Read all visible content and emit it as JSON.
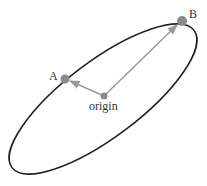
{
  "diagram": {
    "ellipse": {
      "cx": 103,
      "cy": 99,
      "rx": 114,
      "ry": 38,
      "rotation": -37,
      "stroke": "#222222"
    },
    "points": {
      "origin": {
        "label": "origin",
        "x": 104,
        "y": 96
      },
      "A": {
        "label": "A",
        "x": 65,
        "y": 79
      },
      "B": {
        "label": "B",
        "x": 182,
        "y": 21
      }
    },
    "arrows": [
      {
        "from": "origin",
        "to": "A"
      },
      {
        "from": "origin",
        "to": "B"
      }
    ],
    "colors": {
      "point": "#8a8a8a",
      "arrow": "#9a9a9a",
      "ellipse": "#222222"
    }
  }
}
